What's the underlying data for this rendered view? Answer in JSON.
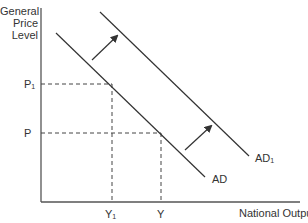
{
  "diagram": {
    "y_axis_label": [
      "General",
      "Price",
      "Level"
    ],
    "x_axis_label": "National Output",
    "price_levels": [
      {
        "label": "P",
        "sub": "1"
      },
      {
        "label": "P",
        "sub": ""
      }
    ],
    "output_levels": [
      {
        "label": "Y",
        "sub": "1"
      },
      {
        "label": "Y",
        "sub": ""
      }
    ],
    "curves": [
      {
        "label": "AD",
        "sub": ""
      },
      {
        "label": "AD",
        "sub": "1"
      }
    ],
    "shift_direction": "right",
    "line_color": "#3a3a3a"
  }
}
